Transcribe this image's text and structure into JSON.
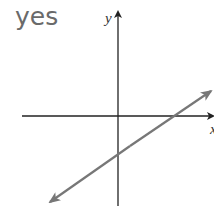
{
  "answer_label": "yes",
  "graph": {
    "y_axis_label": "y",
    "x_axis_label": "x",
    "axis_color": "#222222",
    "line_color": "#777777",
    "line_description": "straight line with positive slope, negative y-intercept, positive x-intercept",
    "intercepts": {
      "y_intercept_sign": "negative",
      "x_intercept_sign": "positive"
    }
  }
}
